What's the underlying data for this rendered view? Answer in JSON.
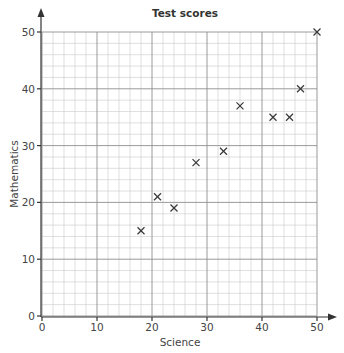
{
  "chart_data": {
    "type": "scatter",
    "title": "Test scores",
    "xlabel": "Science",
    "ylabel": "Mathematics",
    "xlim": [
      0,
      50
    ],
    "ylim": [
      0,
      50
    ],
    "x_ticks": [
      0,
      10,
      20,
      30,
      40,
      50
    ],
    "y_ticks": [
      0,
      10,
      20,
      30,
      40,
      50
    ],
    "grid": true,
    "grid_minor_step": 2,
    "grid_major_step": 10,
    "marker": "x",
    "legend": null,
    "series": [
      {
        "name": "Test scores",
        "points": [
          {
            "x": 18,
            "y": 15
          },
          {
            "x": 21,
            "y": 21
          },
          {
            "x": 24,
            "y": 19
          },
          {
            "x": 28,
            "y": 27
          },
          {
            "x": 33,
            "y": 29
          },
          {
            "x": 36,
            "y": 37
          },
          {
            "x": 42,
            "y": 35
          },
          {
            "x": 45,
            "y": 35
          },
          {
            "x": 47,
            "y": 40
          },
          {
            "x": 50,
            "y": 50
          }
        ]
      }
    ]
  },
  "colors": {
    "minor_grid": "#c9c9c9",
    "major_grid": "#8e8e8e",
    "axis": "#333333",
    "marker": "#3a3a3a"
  }
}
